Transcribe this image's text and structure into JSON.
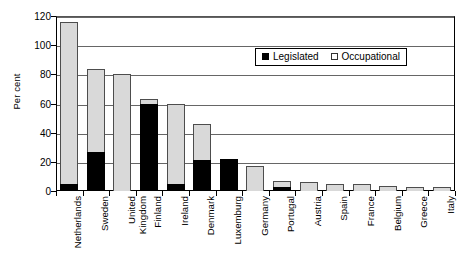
{
  "chart_data": {
    "type": "bar",
    "subtype": "stacked-vertical",
    "title": "",
    "xlabel": "",
    "ylabel": "Per cent",
    "ylim": [
      0,
      120
    ],
    "yticks": [
      0,
      20,
      40,
      60,
      80,
      100,
      120
    ],
    "grid": true,
    "legend_position": "inside-top-right",
    "categories": [
      "Netherlands",
      "Sweden",
      "United\nKingdom",
      "Finland",
      "Ireland",
      "Denmark",
      "Luxemburg",
      "Germany",
      "Portugal",
      "Austria",
      "Spain",
      "France",
      "Belgium",
      "Greece",
      "Italy"
    ],
    "series": [
      {
        "name": "Legislated",
        "color": "#000000",
        "values": [
          5,
          27,
          0,
          60,
          5,
          21.5,
          22,
          0,
          2.5,
          0,
          0,
          0,
          0,
          0,
          0
        ]
      },
      {
        "name": "Occupational",
        "color": "#d9d9d9",
        "values": [
          111,
          57,
          80,
          3,
          54.5,
          24.5,
          0,
          17,
          4.5,
          6,
          5,
          4.5,
          3.5,
          3,
          2.5
        ]
      }
    ],
    "totals": [
      116,
      84,
      80,
      63,
      59.5,
      46,
      22,
      17,
      7,
      6,
      5,
      4.5,
      3.5,
      3,
      2.5
    ]
  },
  "legend": {
    "items": [
      {
        "label": "Legislated",
        "swatch": "filled-square-icon"
      },
      {
        "label": "Occupational",
        "swatch": "open-square-icon"
      }
    ]
  },
  "axis": {
    "y_title": "Per cent"
  }
}
